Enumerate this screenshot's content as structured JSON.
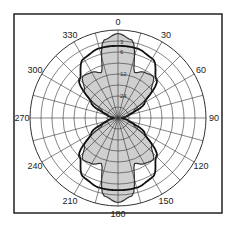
{
  "chart_data": {
    "type": "polar",
    "title": "",
    "angle_unit": "degrees",
    "angle_direction": "clockwise",
    "angle_zero": "top",
    "angular_tick_labels": [
      "0",
      "30",
      "60",
      "90",
      "120",
      "150",
      "180",
      "210",
      "240",
      "270",
      "300",
      "330"
    ],
    "angular_gridline_step": 15,
    "radial_tick_labels": [
      "3",
      "6",
      "12",
      "24"
    ],
    "radial_rings": 8,
    "grid": true,
    "series": [
      {
        "name": "filled-pattern",
        "style": "filled-gray",
        "description": "Figure-eight main lobes at 0 and 180 with side lobes near ±35 and ±145",
        "points": [
          {
            "angle": 0,
            "r": 0.96
          },
          {
            "angle": 10,
            "r": 0.9
          },
          {
            "angle": 20,
            "r": 0.55
          },
          {
            "angle": 30,
            "r": 0.6
          },
          {
            "angle": 40,
            "r": 0.62
          },
          {
            "angle": 50,
            "r": 0.5
          },
          {
            "angle": 65,
            "r": 0.2
          },
          {
            "angle": 90,
            "r": 0.04
          }
        ],
        "symmetry": "mirrored left-right and top-bottom"
      },
      {
        "name": "outline-pattern",
        "style": "bold-black-outline",
        "description": "Wide oval outline with shoulders near ±45 and ±135",
        "points": [
          {
            "angle": 0,
            "r": 0.82
          },
          {
            "angle": 15,
            "r": 0.82
          },
          {
            "angle": 30,
            "r": 0.78
          },
          {
            "angle": 45,
            "r": 0.62
          },
          {
            "angle": 60,
            "r": 0.35
          },
          {
            "angle": 75,
            "r": 0.12
          },
          {
            "angle": 90,
            "r": 0.04
          }
        ],
        "symmetry": "mirrored left-right and top-bottom"
      }
    ]
  }
}
